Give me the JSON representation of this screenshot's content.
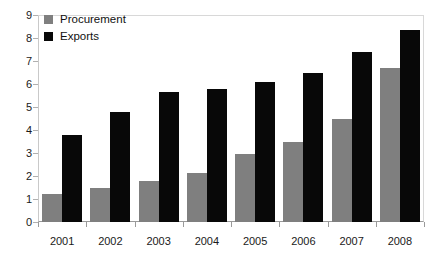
{
  "chart_data": {
    "type": "bar",
    "title": "",
    "xlabel": "",
    "ylabel": "",
    "ylim": [
      0,
      9
    ],
    "ytick_step": 1,
    "yticks": [
      "9",
      "8",
      "7",
      "6",
      "5",
      "4",
      "3",
      "2",
      "1",
      "0"
    ],
    "grid": false,
    "legend_position": "top-left",
    "categories": [
      "2001",
      "2002",
      "2003",
      "2004",
      "2005",
      "2006",
      "2007",
      "2008"
    ],
    "series": [
      {
        "name": "Procurement",
        "color": "#7f7f7f",
        "values": [
          1.2,
          1.5,
          1.8,
          2.15,
          2.95,
          3.5,
          4.5,
          6.7
        ]
      },
      {
        "name": "Exports",
        "color": "#080808",
        "values": [
          3.8,
          4.8,
          5.65,
          5.8,
          6.1,
          6.5,
          7.4,
          8.35
        ]
      }
    ]
  },
  "legend": {
    "items": [
      {
        "label": "Procurement",
        "swatch": "procurement-swatch"
      },
      {
        "label": "Exports",
        "swatch": "exports-swatch"
      }
    ]
  }
}
